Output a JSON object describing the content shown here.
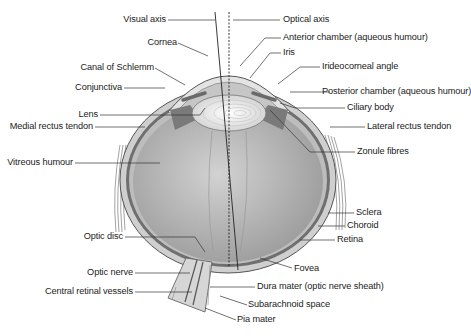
{
  "diagram": {
    "colors": {
      "line": "#333333",
      "sclera": "#c9c9c9",
      "vitreous": "#a9a9a9",
      "lens": "#e6e6e6",
      "choroid": "#6f6f6f",
      "background": "#ffffff"
    },
    "labels": {
      "visual_axis": "Visual axis",
      "optical_axis": "Optical axis",
      "cornea": "Cornea",
      "anterior_chamber": "Anterior chamber (aqueous humour)",
      "iris": "Iris",
      "canal_of_schlemm": "Canal of Schlemm",
      "irideocorneal_angle": "Irideocorneal angle",
      "conjunctiva": "Conjunctiva",
      "posterior_chamber": "Posterior chamber (aqueous humour)",
      "lens": "Lens",
      "ciliary_body": "Ciliary body",
      "medial_rectus_tendon": "Medial rectus tendon",
      "lateral_rectus_tendon": "Lateral rectus tendon",
      "zonule_fibres": "Zonule fibres",
      "vitreous_humour": "Vitreous humour",
      "sclera": "Sclera",
      "choroid": "Choroid",
      "retina": "Retina",
      "optic_disc": "Optic disc",
      "fovea": "Fovea",
      "optic_nerve": "Optic nerve",
      "dura_mater": "Dura mater (optic nerve sheath)",
      "central_retinal_vessels": "Central retinal vessels",
      "subarachnoid_space": "Subarachnoid space",
      "pia_mater": "Pia mater"
    }
  }
}
